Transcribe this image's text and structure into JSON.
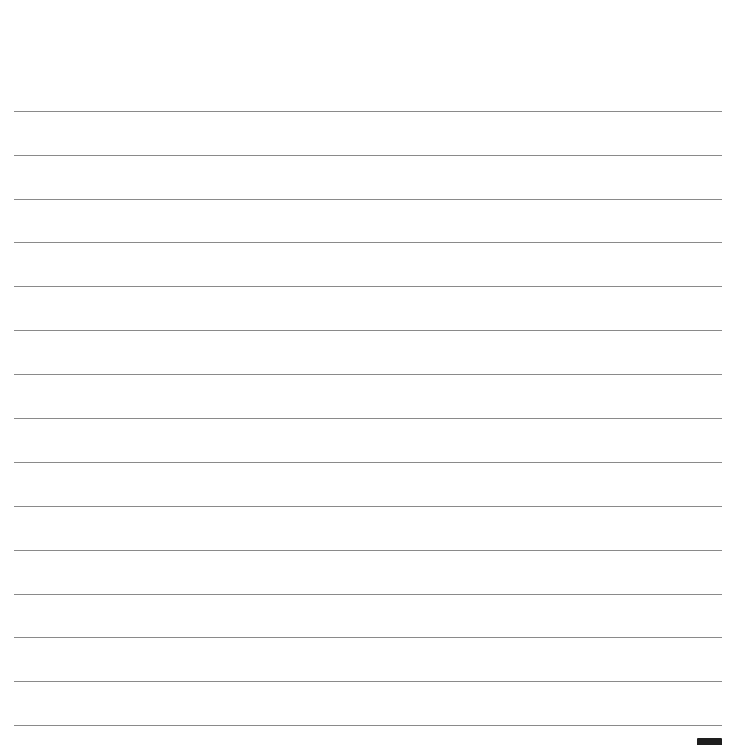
{
  "page": {
    "type": "lined-paper",
    "background_color": "#ffffff",
    "line_color": "#8a8a8a",
    "line_count": 15,
    "line_positions_y": [
      111,
      155,
      199,
      242,
      286,
      330,
      374,
      418,
      462,
      506,
      550,
      594,
      637,
      681,
      725
    ],
    "corner_tab_color": "#1e1e1e"
  }
}
